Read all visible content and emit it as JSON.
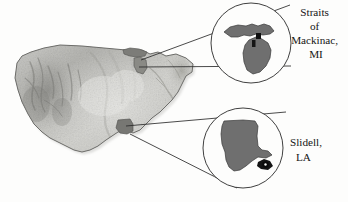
{
  "figure": {
    "background_color": "#fdfdfc",
    "basemap": {
      "name": "contiguous-united-states-shaded-relief",
      "style": "grayscale hillshade",
      "land_light": "#e9e9e7",
      "land_mid": "#b9b9b6",
      "land_dark": "#8a8a87",
      "outline_color": "#6d6d6a"
    },
    "bleed_through_text": "Environmental Processes",
    "leader_line_color": "#2a2a2a",
    "inset_circle_stroke": "#2a2a2a",
    "inset_state_fill": "#6f6f6f",
    "inset_state_stroke": "#3a3a3a",
    "site_marker_color": "#101010"
  },
  "insets": [
    {
      "id": "inset-michigan",
      "state_name": "Michigan",
      "state_abbr": "MI",
      "label_lines": [
        "Straits",
        "of",
        "Mackinac,",
        "MI"
      ],
      "label_full": "Straits of Mackinac, MI",
      "circle": {
        "cx": 251,
        "cy": 43,
        "r": 40
      },
      "label_anchor": {
        "x": 316,
        "y": 16
      },
      "marker": {
        "x": 259,
        "y": 38
      },
      "source_point_on_map": {
        "x": 137,
        "y": 63
      }
    },
    {
      "id": "inset-louisiana",
      "state_name": "Louisiana",
      "state_abbr": "LA",
      "label_lines": [
        "Slidell,",
        "LA"
      ],
      "label_full": "Slidell, LA",
      "circle": {
        "cx": 243,
        "cy": 148,
        "r": 40
      },
      "label_anchor": {
        "x": 290,
        "y": 146
      },
      "marker": {
        "x": 266,
        "y": 168
      },
      "source_point_on_map": {
        "x": 128,
        "y": 130
      }
    }
  ],
  "leader_lines": [
    {
      "name": "michigan-upper-leader",
      "x1": 141,
      "y1": 60,
      "x2": 290,
      "y2": 5
    },
    {
      "name": "michigan-lower-leader",
      "x1": 139,
      "y1": 67,
      "x2": 291,
      "y2": 66
    },
    {
      "name": "louisiana-upper-leader",
      "x1": 126,
      "y1": 126,
      "x2": 286,
      "y2": 112
    },
    {
      "name": "louisiana-lower-leader",
      "x1": 130,
      "y1": 134,
      "x2": 237,
      "y2": 188
    }
  ]
}
